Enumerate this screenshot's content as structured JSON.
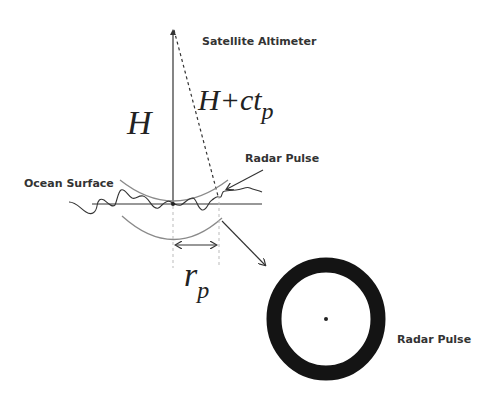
{
  "diagram": {
    "labels": {
      "satellite": "Satellite Altimeter",
      "ocean_surface": "Ocean Surface",
      "radar_pulse_top": "Radar Pulse",
      "radar_pulse_bottom": "Radar Pulse"
    },
    "math": {
      "height": "H",
      "slant_base": "H+ct",
      "slant_sub": "p",
      "radius_base": "r",
      "radius_sub": "p"
    },
    "colors": {
      "line": "#333333",
      "arc": "#8a8a8a",
      "dashed_guide": "#bbbbbb",
      "ring": "#141414"
    }
  }
}
